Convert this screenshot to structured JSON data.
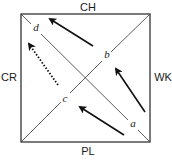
{
  "diagram": {
    "type": "square-with-diagonals",
    "square": {
      "x": 21,
      "y": 14,
      "width": 129,
      "height": 128,
      "stroke": "#222222"
    },
    "edge_labels": {
      "top": {
        "text": "CH",
        "x": 88,
        "y": 11
      },
      "bottom": {
        "text": "PL",
        "x": 88,
        "y": 155
      },
      "left": {
        "text": "CR",
        "x": 9,
        "y": 81
      },
      "right": {
        "text": "WK",
        "x": 163,
        "y": 81
      }
    },
    "point_labels": [
      {
        "id": "d",
        "text": "d",
        "x": 36,
        "y": 31
      },
      {
        "id": "b",
        "text": "b",
        "x": 107,
        "y": 58
      },
      {
        "id": "c",
        "text": "c",
        "x": 65,
        "y": 102
      },
      {
        "id": "a",
        "text": "a",
        "x": 133,
        "y": 127
      }
    ],
    "arrows": [
      {
        "id": "arrow-top",
        "from": [
          93,
          46
        ],
        "to": [
          50,
          19
        ],
        "style": "solid"
      },
      {
        "id": "arrow-right",
        "from": [
          145,
          112
        ],
        "to": [
          116,
          69
        ],
        "style": "solid"
      },
      {
        "id": "arrow-bottom",
        "from": [
          124,
          135
        ],
        "to": [
          80,
          107
        ],
        "style": "solid"
      },
      {
        "id": "arrow-dotted",
        "from": [
          58,
          85
        ],
        "to": [
          29,
          44
        ],
        "style": "dotted"
      }
    ]
  }
}
